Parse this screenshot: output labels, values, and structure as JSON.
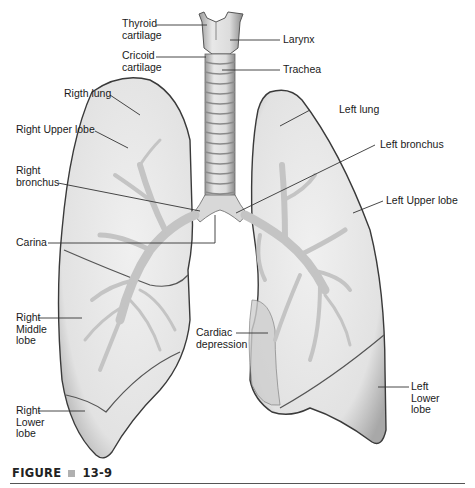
{
  "figure": {
    "caption_prefix": "FIGURE",
    "caption_number": "13-9",
    "accent_square_color": "#b0b0b0"
  },
  "labels": {
    "thyroid_cartilage": "Thyroid\ncartilage",
    "cricoid_cartilage": "Cricoid\ncartilage",
    "larynx": "Larynx",
    "trachea": "Trachea",
    "right_lung": "Rigth lung",
    "right_upper_lobe": "Right Upper lobe",
    "right_bronchus": "Right\nbronchus",
    "carina": "Carina",
    "right_middle_lobe": "Right\nMiddle\nlobe",
    "right_lower_lobe": "Right\nLower\nlobe",
    "left_lung": "Left lung",
    "left_bronchus": "Left bronchus",
    "left_upper_lobe": "Left Upper lobe",
    "cardiac_depression": "Cardiac\ndepression",
    "left_lower_lobe": "Left\nLower\nlobe"
  },
  "colors": {
    "lung_fill": "#e6e6e6",
    "lung_outline": "#3a3a3a",
    "bronchi_fill": "#c4c4c4",
    "leader_line": "#333333"
  }
}
